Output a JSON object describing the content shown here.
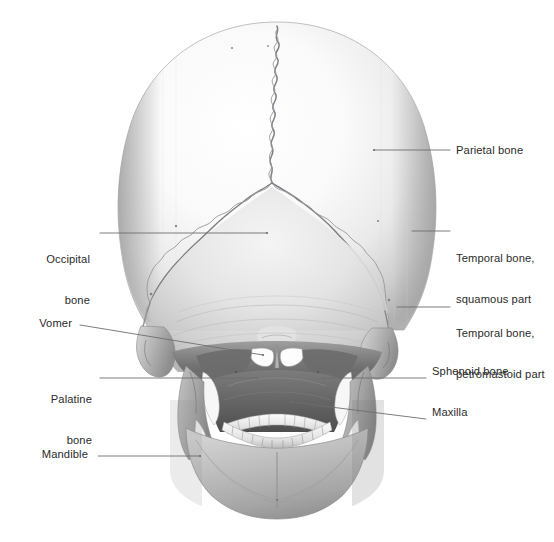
{
  "figure": {
    "view": "posterior",
    "background_color": "#ffffff",
    "label_text_color": "#2b2b2b",
    "leader_line_color": "#6e6e73",
    "bone_light_color": "#fbfbfb",
    "bone_mid_color": "#c9c9c9",
    "bone_shadow_color": "#8e8e8e",
    "cavity_dark_color": "#4a4a4a",
    "suture_color": "#7d7d82"
  },
  "labels": [
    {
      "id": "parietal-bone",
      "text": "Parietal bone",
      "side": "right",
      "lines": [
        "Parietal bone"
      ],
      "text_x": 456,
      "text_y": 144,
      "leader": {
        "x1": 374,
        "y1": 150,
        "x2": 450,
        "y2": 150
      }
    },
    {
      "id": "temporal-bone-squamous-part",
      "text": "Temporal bone, squamous part",
      "side": "right",
      "lines": [
        "Temporal bone,",
        "squamous part"
      ],
      "text_x": 456,
      "text_y": 225,
      "leader": {
        "x1": 412,
        "y1": 231,
        "x2": 450,
        "y2": 231
      }
    },
    {
      "id": "temporal-bone-petromastoid-part",
      "text": "Temporal bone, petromastoid part",
      "side": "right",
      "lines": [
        "Temporal bone,",
        "petromastoid part"
      ],
      "text_x": 456,
      "text_y": 300,
      "leader": {
        "x1": 397,
        "y1": 307,
        "x2": 450,
        "y2": 307
      }
    },
    {
      "id": "sphenoid-bone",
      "text": "Sphenoid bone",
      "side": "right",
      "lines": [
        "Sphenoid bone"
      ],
      "text_x": 432,
      "text_y": 365,
      "leader": {
        "x1": 322,
        "y1": 378,
        "x2": 426,
        "y2": 378
      }
    },
    {
      "id": "maxilla",
      "text": "Maxilla",
      "side": "right",
      "lines": [
        "Maxilla"
      ],
      "text_x": 432,
      "text_y": 406,
      "leader": {
        "x1": 291,
        "y1": 402,
        "x2": 426,
        "y2": 419
      }
    },
    {
      "id": "occipital-bone",
      "text": "Occipital bone",
      "side": "left",
      "lines": [
        "Occipital",
        "bone"
      ],
      "text_right": 90,
      "text_y": 226,
      "leader": {
        "x1": 100,
        "y1": 233,
        "x2": 267,
        "y2": 233
      }
    },
    {
      "id": "vomer",
      "text": "Vomer",
      "side": "left",
      "lines": [
        "Vomer"
      ],
      "text_right": 72,
      "text_y": 317,
      "leader": {
        "x1": 80,
        "y1": 325,
        "x2": 263,
        "y2": 355
      }
    },
    {
      "id": "palatine-bone",
      "text": "Palatine bone",
      "side": "left",
      "lines": [
        "Palatine",
        "bone"
      ],
      "text_right": 92,
      "text_y": 366,
      "leader": {
        "x1": 100,
        "y1": 378,
        "x2": 257,
        "y2": 378
      }
    },
    {
      "id": "mandible",
      "text": "Mandible",
      "side": "left",
      "lines": [
        "Mandible"
      ],
      "text_right": 88,
      "text_y": 438,
      "leader": {
        "x1": 98,
        "y1": 456,
        "x2": 200,
        "y2": 456
      }
    }
  ],
  "structures": [
    {
      "id": "cranial-vault",
      "name": "Cranial vault (calvaria)"
    },
    {
      "id": "sagittal-suture",
      "name": "Sagittal suture"
    },
    {
      "id": "lambdoid-suture-left",
      "name": "Lambdoid suture, left"
    },
    {
      "id": "lambdoid-suture-right",
      "name": "Lambdoid suture, right"
    },
    {
      "id": "occipitomastoid-suture-left",
      "name": "Occipitomastoid suture, left"
    },
    {
      "id": "occipitomastoid-suture-right",
      "name": "Occipitomastoid suture, right"
    },
    {
      "id": "external-occipital-protuberance",
      "name": "External occipital protuberance"
    },
    {
      "id": "nuchal-lines",
      "name": "Nuchal lines"
    },
    {
      "id": "mastoid-process-left",
      "name": "Mastoid process, left"
    },
    {
      "id": "mastoid-process-right",
      "name": "Mastoid process, right"
    },
    {
      "id": "choana-left",
      "name": "Choana, left"
    },
    {
      "id": "choana-right",
      "name": "Choana, right"
    },
    {
      "id": "vomer-crest",
      "name": "Vomer"
    },
    {
      "id": "maxillary-teeth",
      "name": "Maxillary dental arch"
    },
    {
      "id": "mandibular-teeth",
      "name": "Mandibular dental arch"
    },
    {
      "id": "mandible-body",
      "name": "Body of mandible"
    },
    {
      "id": "mental-protuberance",
      "name": "Mental protuberance"
    }
  ]
}
